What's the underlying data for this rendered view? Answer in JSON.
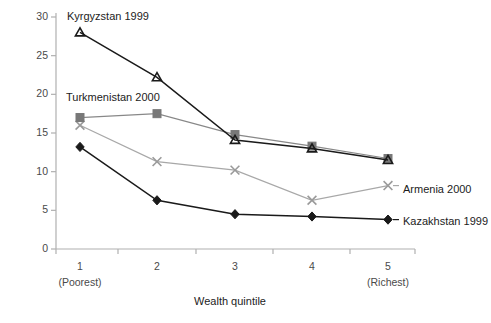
{
  "chart_data": {
    "type": "line",
    "title": "",
    "xlabel": "Wealth quintile",
    "ylabel": "",
    "xlim": [
      0.5,
      5.5
    ],
    "ylim": [
      0,
      30
    ],
    "grid": false,
    "legend_position": "inline-annotations",
    "categories": [
      "1",
      "2",
      "3",
      "4",
      "5"
    ],
    "x_tick_labels": [
      "1",
      "2",
      "3",
      "4",
      "5"
    ],
    "x_tick_sublabels": [
      "(Poorest)",
      "",
      "",
      "",
      "(Richest)"
    ],
    "y_tick_labels": [
      "0",
      "5",
      "10",
      "15",
      "20",
      "25",
      "30"
    ],
    "y_ticks": [
      0,
      5,
      10,
      15,
      20,
      25,
      30
    ],
    "series": [
      {
        "name": "Kyrgyzstan 1999",
        "marker": "triangle",
        "color": "#1a1a1a",
        "line_color": "#1a1a1a",
        "values": [
          28.0,
          22.2,
          14.1,
          13.0,
          11.5
        ],
        "label_position": "above-first-point"
      },
      {
        "name": "Turkmenistan 2000",
        "marker": "square",
        "color": "#787878",
        "line_color": "#888888",
        "values": [
          17.0,
          17.5,
          14.8,
          13.3,
          11.7
        ],
        "label_position": "above-first-point"
      },
      {
        "name": "Armenia 2000",
        "marker": "x",
        "color": "#9a9a9a",
        "line_color": "#a8a8a8",
        "values": [
          16.0,
          11.3,
          10.2,
          6.3,
          8.2
        ],
        "label_position": "right-of-last-point"
      },
      {
        "name": "Kazakhstan 1999",
        "marker": "diamond",
        "color": "#1a1a1a",
        "line_color": "#1a1a1a",
        "values": [
          13.2,
          6.3,
          4.5,
          4.2,
          3.8
        ],
        "label_position": "right-of-last-point"
      }
    ],
    "axis_color": "#b0b0b0",
    "background": "#ffffff"
  },
  "annotations": {
    "kyrgyzstan_label": "Kyrgyzstan 1999",
    "turkmenistan_label": "Turkmenistan 2000",
    "armenia_label": "Armenia 2000",
    "kazakhstan_label": "Kazakhstan 1999"
  },
  "axes": {
    "x_title": "Wealth quintile",
    "x_labels": [
      "1",
      "2",
      "3",
      "4",
      "5"
    ],
    "x_sublabel_first": "(Poorest)",
    "x_sublabel_last": "(Richest)",
    "y_labels": [
      "30",
      "25",
      "20",
      "15",
      "10",
      "5",
      "0"
    ]
  }
}
